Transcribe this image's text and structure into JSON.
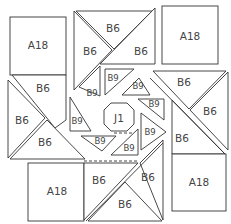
{
  "diagram": {
    "type": "quilt-block-pattern",
    "pieces": {
      "a18_top_left": "A18",
      "a18_top_right": "A18",
      "a18_bottom_left": "A18",
      "a18_bottom_right": "A18",
      "b6_top_left_tri": "B6",
      "b6_top_upper_tri": "B6",
      "b6_top_right_tri": "B6",
      "b6_left_upper": "B6",
      "b6_left_mid": "B6",
      "b6_left_lower": "B6",
      "b6_right_upper": "B6",
      "b6_right_mid": "B6",
      "b6_right_lower": "B6",
      "b6_bottom_left": "B6",
      "b6_bottom_right_upper": "B6",
      "b6_bottom_lower": "B6",
      "b9_1": "B9",
      "b9_2": "B9",
      "b9_3": "B9",
      "b9_4": "B9",
      "b9_5": "B9",
      "b9_6": "B9",
      "b9_7": "B9",
      "b9_8": "B9",
      "center": "J1"
    }
  }
}
